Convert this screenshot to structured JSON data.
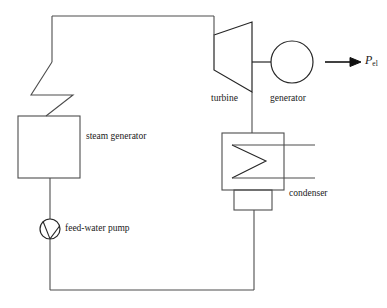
{
  "diagram": {
    "stroke_color": "#4d4d4d",
    "stroke_color_dark": "#262626",
    "background": "#ffffff",
    "labels": {
      "steam_generator": "steam generator",
      "feed_water_pump": "feed-water pump",
      "turbine": "turbine",
      "generator": "generator",
      "condenser": "condenser",
      "electric_power_symbol": "P",
      "electric_power_subscript": "el"
    },
    "components": [
      {
        "name": "steam-generator",
        "shape": "rectangle",
        "label": "steam generator",
        "x": 18,
        "y": 116,
        "width": 62,
        "height": 62
      },
      {
        "name": "feed-water-pump",
        "shape": "circle-with-chord",
        "label": "feed-water pump",
        "cx": 50,
        "cy": 229,
        "r": 10
      },
      {
        "name": "turbine",
        "shape": "trapezoid",
        "label": "turbine",
        "x": 214,
        "y": 35,
        "width": 38,
        "left_height": 17,
        "right_height": 57
      },
      {
        "name": "generator",
        "shape": "circle",
        "label": "generator",
        "cx": 292,
        "cy": 62,
        "r": 21
      },
      {
        "name": "condenser",
        "shape": "rectangle-with-zigzag-coil",
        "label": "condenser",
        "x": 222,
        "y": 133,
        "width": 62,
        "height": 57
      },
      {
        "name": "hotwell",
        "shape": "rectangle",
        "label": "",
        "x": 234,
        "y": 190,
        "width": 38,
        "height": 20
      }
    ],
    "flows": [
      {
        "name": "steam-line-top",
        "from": "steam-generator",
        "to": "turbine"
      },
      {
        "name": "turbine-shaft",
        "from": "turbine",
        "to": "generator"
      },
      {
        "name": "exhaust-steam-line",
        "from": "turbine",
        "to": "condenser"
      },
      {
        "name": "condensate-line",
        "from": "hotwell",
        "to": "feed-water-pump"
      },
      {
        "name": "feed-water-line",
        "from": "feed-water-pump",
        "to": "steam-generator"
      },
      {
        "name": "cooling-water-inlet",
        "from": "condenser",
        "to": "external"
      },
      {
        "name": "cooling-water-outlet",
        "from": "condenser",
        "to": "external"
      },
      {
        "name": "electric-power-output",
        "from": "generator",
        "to": "grid"
      }
    ]
  }
}
